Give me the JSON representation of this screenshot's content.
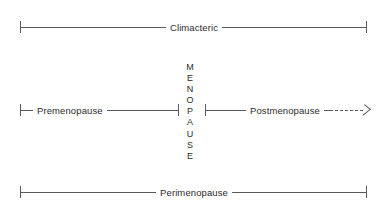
{
  "diagram": {
    "background_color": "#ffffff",
    "line_color": "#5a5a5a",
    "text_color": "#2b2b2b",
    "spans": {
      "climacteric": {
        "label": "Climacteric",
        "start_px": 20,
        "end_px": 366,
        "y_px": 27,
        "style": "solid-bracket"
      },
      "premenopause": {
        "label": "Premenopause",
        "start_px": 20,
        "end_px": 178,
        "y_px": 110,
        "style": "solid-bracket"
      },
      "postmenopause": {
        "label": "Postmenopause",
        "start_px": 205,
        "end_px": 368,
        "y_px": 110,
        "style": "solid-to-dashed-arrow"
      },
      "perimenopause": {
        "label": "Perimenopause",
        "start_px": 20,
        "end_px": 366,
        "y_px": 192,
        "style": "solid-bracket"
      }
    },
    "menopause_event": {
      "label": "MENOPAUSE",
      "letters": [
        "M",
        "E",
        "N",
        "O",
        "P",
        "A",
        "U",
        "S",
        "E"
      ],
      "orientation": "vertical",
      "x_px": 190,
      "top_px": 62,
      "bottom_px": 160
    }
  }
}
